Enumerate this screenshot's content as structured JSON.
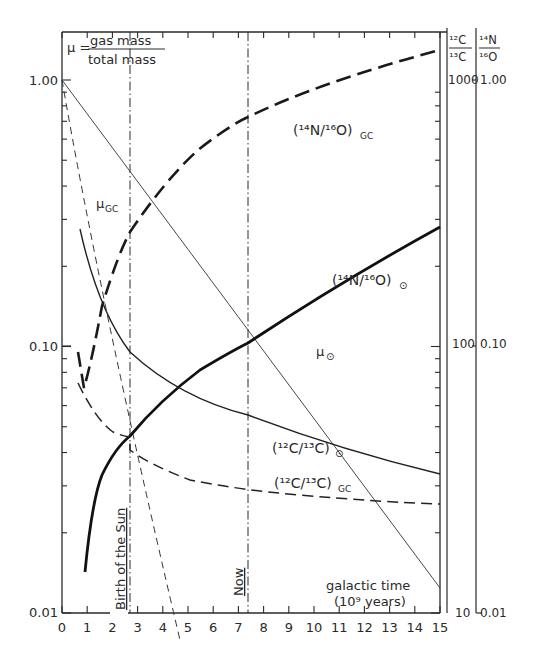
{
  "chart_data": {
    "type": "line",
    "title": "",
    "formula": {
      "lhs": "μ =",
      "numerator": "gas   mass",
      "denominator": "total mass"
    },
    "xlabel": "galactic time",
    "xlabel_units": "(10⁹ years)",
    "ylabel": "μ",
    "xlim": [
      0,
      15
    ],
    "ylim": [
      0.01,
      1.3
    ],
    "yscale": "log",
    "x_ticks": [
      "0",
      "1",
      "2",
      "3",
      "4",
      "5",
      "6",
      "7",
      "8",
      "9",
      "10",
      "11",
      "12",
      "13",
      "14",
      "15"
    ],
    "y_ticks_left": [
      "0.01",
      "0.10",
      "1.00"
    ],
    "right_axis_1": {
      "label_top": "12C",
      "label_bottom": "13C",
      "ticks": [
        "10",
        "100",
        "1000"
      ]
    },
    "right_axis_2": {
      "label_top": "14N",
      "label_bottom": "16O",
      "ticks": [
        "0.01",
        "0.10",
        "1.00"
      ]
    },
    "annotations": [
      {
        "text": "Birth of the Sun",
        "x": 2.7,
        "style": "dash-dot vertical"
      },
      {
        "text": "Now",
        "x": 7.4,
        "style": "dash-dot vertical"
      }
    ],
    "series": [
      {
        "name": "μ⊙",
        "label": "μ",
        "sub": "⊙",
        "style": "thin solid",
        "x": [
          0,
          2.7,
          7.4,
          15
        ],
        "y": [
          1.0,
          0.52,
          0.155,
          0.025
        ]
      },
      {
        "name": "μGC",
        "label": "μ",
        "sub": "GC",
        "style": "thin dashed",
        "x": [
          0,
          1,
          2,
          3,
          4,
          4.6
        ],
        "y": [
          1.0,
          0.37,
          0.135,
          0.05,
          0.018,
          0.01
        ]
      },
      {
        "name": "(14N/16O)GC",
        "label": "(¹⁴N/¹⁶O)",
        "sub": "GC",
        "style": "heavy dashed",
        "axis": "right 14N/16O",
        "x": [
          0.7,
          1.0,
          1.5,
          2.0,
          2.7,
          4,
          5.5,
          7.4,
          10,
          12.5,
          15
        ],
        "y": [
          0.09,
          0.055,
          0.13,
          0.21,
          0.32,
          0.48,
          0.6,
          0.75,
          0.95,
          1.12,
          1.3
        ]
      },
      {
        "name": "(14N/16O)⊙",
        "label": "(¹⁴N/¹⁶O)",
        "sub": "⊙",
        "style": "heavy solid",
        "axis": "right 14N/16O",
        "x": [
          0.9,
          1.5,
          2.0,
          2.7,
          3.5,
          4.5,
          6,
          7.4,
          9,
          11,
          13,
          15
        ],
        "y": [
          0.014,
          0.026,
          0.037,
          0.048,
          0.06,
          0.076,
          0.1,
          0.12,
          0.15,
          0.19,
          0.23,
          0.28
        ]
      },
      {
        "name": "(12C/13C)⊙",
        "label": "(¹²C/¹³C)",
        "sub": "⊙",
        "style": "thin solid",
        "axis": "right 12C/13C",
        "x": [
          0.7,
          1.5,
          2.7,
          4,
          5.5,
          7.4,
          10,
          12.5,
          15
        ],
        "y": [
          270,
          150,
          90,
          65,
          52,
          45,
          38,
          35,
          33
        ]
      },
      {
        "name": "(12C/13C)GC",
        "label": "(¹²C/¹³C)",
        "sub": "GC",
        "style": "dashed",
        "axis": "right 12C/13C",
        "x": [
          0.6,
          1.2,
          2.0,
          2.7,
          4,
          6,
          7.4,
          10,
          12.5,
          15
        ],
        "y": [
          90,
          55,
          40,
          36,
          32,
          29,
          28,
          27,
          26,
          25.5
        ]
      }
    ],
    "grid": false,
    "legend": "inline labels"
  },
  "labels": {
    "mu_sun": "μ",
    "mu_sun_sub": "⊙",
    "mu_gc": "μ",
    "mu_gc_sub": "GC",
    "n_o_gc": "(¹⁴N/¹⁶O)",
    "n_o_gc_sub": "GC",
    "n_o_sun": "(¹⁴N/¹⁶O)",
    "n_o_sun_sub": "⊙",
    "c_c_sun": "(¹²C/¹³C)",
    "c_c_sun_sub": "⊙",
    "c_c_gc": "(¹²C/¹³C)",
    "c_c_gc_sub": "GC",
    "birth": "Birth of the Sun",
    "now": "Now",
    "xlabel1": "galactic time",
    "xlabel2": "(10⁹ years)",
    "formula_lhs": "μ =",
    "formula_num": "gas   mass",
    "formula_den": "total mass",
    "r1_top": "¹²C",
    "r1_bot": "¹³C",
    "r2_top": "¹⁴N",
    "r2_bot": "¹⁶O",
    "r1_1000": "1000",
    "r1_100": "100",
    "r1_10": "10",
    "r2_100": "1.00",
    "r2_010": "0.10",
    "r2_001": "0.01",
    "y_100": "1.00",
    "y_010": "0.10",
    "y_001": "0.01"
  }
}
